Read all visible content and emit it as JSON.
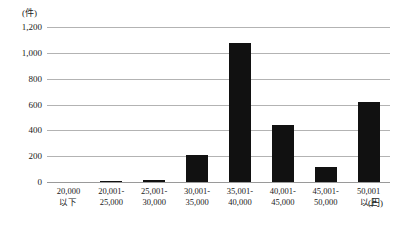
{
  "chart_data": {
    "type": "bar",
    "title": "",
    "subtitle": "",
    "xlabel": "(円)",
    "ylabel": "(件)",
    "categories": [
      "20,000 以下",
      "20,001-25,000",
      "25,001-30,000",
      "30,001-35,000",
      "35,001-40,000",
      "40,001-45,000",
      "45,001-50,000",
      "50,001 以上"
    ],
    "category_lines": [
      {
        "line1": "20,000",
        "line2": "以下"
      },
      {
        "line1": "20,001-",
        "line2": "25,000"
      },
      {
        "line1": "25,001-",
        "line2": "30,000"
      },
      {
        "line1": "30,001-",
        "line2": "35,000"
      },
      {
        "line1": "35,001-",
        "line2": "40,000"
      },
      {
        "line1": "40,001-",
        "line2": "45,000"
      },
      {
        "line1": "45,001-",
        "line2": "50,000"
      },
      {
        "line1": "50,001",
        "line2": "以上"
      }
    ],
    "values": [
      0,
      6,
      18,
      210,
      1075,
      440,
      115,
      620
    ],
    "ylim": [
      0,
      1200
    ],
    "yticks": [
      0,
      200,
      400,
      600,
      800,
      1000,
      1200
    ],
    "ytick_labels": [
      "0",
      "200",
      "400",
      "600",
      "800",
      "1,000",
      "1,200"
    ],
    "grid": true,
    "legend": "none",
    "bar_color": "#111111",
    "grid_color": "#b3b3b3",
    "axis_color": "#9a9a9a",
    "background_color": "#ffffff"
  }
}
